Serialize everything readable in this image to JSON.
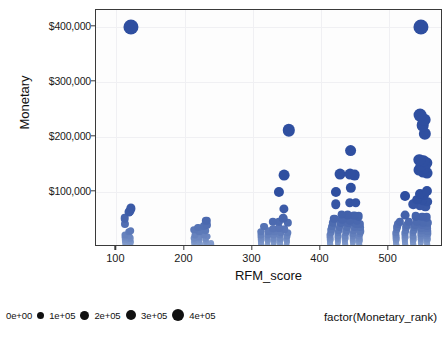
{
  "chart_data": {
    "type": "scatter",
    "title": "",
    "xlabel": "RFM_score",
    "ylabel": "Monetary",
    "xlim": [
      70,
      580
    ],
    "ylim": [
      0,
      430000
    ],
    "grid": true,
    "x_ticks": [
      100,
      200,
      300,
      400,
      500
    ],
    "x_tick_labels": [
      "100",
      "200",
      "300",
      "400",
      "500"
    ],
    "y_ticks": [
      100000,
      200000,
      300000,
      400000
    ],
    "y_tick_labels": [
      "$100,000",
      "$200,000",
      "$300,000",
      "$400,000"
    ],
    "size_encoding": "Monetary",
    "color_encoding": "Monetary",
    "color_low": "#cfe3f5",
    "color_high": "#2f4fa0",
    "legend": {
      "title": "factor(Monetary_rank)",
      "position": "bottom",
      "entries": [
        {
          "label": "0e+00",
          "value": 0,
          "dot_px": 0
        },
        {
          "label": "1e+05",
          "value": 100000,
          "dot_px": 7
        },
        {
          "label": "2e+05",
          "value": 200000,
          "dot_px": 9
        },
        {
          "label": "3e+05",
          "value": 300000,
          "dot_px": 10.5
        },
        {
          "label": "4e+05",
          "value": 400000,
          "dot_px": 12
        }
      ]
    },
    "points": [
      [
        121,
        400000
      ],
      [
        112,
        52000
      ],
      [
        118,
        63000
      ],
      [
        121,
        70000
      ],
      [
        120,
        66000
      ],
      [
        112,
        41000
      ],
      [
        118,
        28000
      ],
      [
        121,
        30000
      ],
      [
        113,
        22000
      ],
      [
        119,
        20000
      ],
      [
        112,
        17000
      ],
      [
        118,
        15500
      ],
      [
        121,
        16500
      ],
      [
        113,
        12500
      ],
      [
        119,
        11500
      ],
      [
        112,
        9000
      ],
      [
        118,
        8500
      ],
      [
        121,
        9500
      ],
      [
        114,
        6500
      ],
      [
        119,
        6000
      ],
      [
        113,
        4500
      ],
      [
        118,
        4000
      ],
      [
        121,
        4200
      ],
      [
        114,
        2800
      ],
      [
        119,
        2400
      ],
      [
        113,
        1600
      ],
      [
        118,
        1400
      ],
      [
        121,
        1500
      ],
      [
        115,
        900
      ],
      [
        119,
        800
      ],
      [
        114,
        500
      ],
      [
        119,
        450
      ],
      [
        117,
        250
      ],
      [
        120,
        200
      ],
      [
        232,
        47000
      ],
      [
        228,
        38000
      ],
      [
        233,
        40000
      ],
      [
        220,
        35000
      ],
      [
        214,
        31000
      ],
      [
        222,
        29000
      ],
      [
        231,
        30000
      ],
      [
        215,
        22000
      ],
      [
        228,
        21000
      ],
      [
        234,
        19000
      ],
      [
        214,
        16000
      ],
      [
        222,
        17500
      ],
      [
        231,
        15500
      ],
      [
        215,
        12000
      ],
      [
        223,
        12500
      ],
      [
        232,
        11000
      ],
      [
        214,
        9000
      ],
      [
        222,
        9500
      ],
      [
        231,
        8500
      ],
      [
        239,
        8000
      ],
      [
        215,
        6500
      ],
      [
        223,
        6000
      ],
      [
        232,
        5500
      ],
      [
        240,
        5200
      ],
      [
        214,
        4200
      ],
      [
        222,
        3800
      ],
      [
        231,
        4000
      ],
      [
        239,
        3500
      ],
      [
        215,
        2600
      ],
      [
        223,
        2300
      ],
      [
        232,
        2400
      ],
      [
        240,
        2200
      ],
      [
        214,
        1500
      ],
      [
        222,
        1300
      ],
      [
        231,
        1400
      ],
      [
        239,
        1200
      ],
      [
        216,
        700
      ],
      [
        224,
        600
      ],
      [
        232,
        650
      ],
      [
        240,
        550
      ],
      [
        218,
        250
      ],
      [
        226,
        200
      ],
      [
        234,
        220
      ],
      [
        241,
        180
      ],
      [
        353,
        212000
      ],
      [
        346,
        130000
      ],
      [
        339,
        99000
      ],
      [
        346,
        69000
      ],
      [
        345,
        52000
      ],
      [
        330,
        46000
      ],
      [
        339,
        45000
      ],
      [
        352,
        44000
      ],
      [
        317,
        37000
      ],
      [
        330,
        33000
      ],
      [
        339,
        34000
      ],
      [
        347,
        32000
      ],
      [
        312,
        28000
      ],
      [
        323,
        28500
      ],
      [
        332,
        27000
      ],
      [
        342,
        26500
      ],
      [
        352,
        25500
      ],
      [
        313,
        22000
      ],
      [
        322,
        22500
      ],
      [
        331,
        21000
      ],
      [
        341,
        21500
      ],
      [
        351,
        20500
      ],
      [
        313,
        17000
      ],
      [
        322,
        17500
      ],
      [
        331,
        16500
      ],
      [
        341,
        16000
      ],
      [
        350,
        15500
      ],
      [
        313,
        13500
      ],
      [
        322,
        13000
      ],
      [
        331,
        13500
      ],
      [
        341,
        12500
      ],
      [
        350,
        12000
      ],
      [
        313,
        10000
      ],
      [
        322,
        10500
      ],
      [
        331,
        9800
      ],
      [
        341,
        9500
      ],
      [
        350,
        9200
      ],
      [
        313,
        7500
      ],
      [
        322,
        7200
      ],
      [
        331,
        7400
      ],
      [
        341,
        7000
      ],
      [
        350,
        6800
      ],
      [
        313,
        5200
      ],
      [
        322,
        5000
      ],
      [
        331,
        5100
      ],
      [
        341,
        4800
      ],
      [
        350,
        4600
      ],
      [
        313,
        3400
      ],
      [
        322,
        3200
      ],
      [
        331,
        3300
      ],
      [
        341,
        3000
      ],
      [
        350,
        2900
      ],
      [
        314,
        2000
      ],
      [
        323,
        1900
      ],
      [
        332,
        1950
      ],
      [
        341,
        1800
      ],
      [
        350,
        1700
      ],
      [
        314,
        1100
      ],
      [
        323,
        1000
      ],
      [
        332,
        1050
      ],
      [
        341,
        950
      ],
      [
        350,
        900
      ],
      [
        315,
        450
      ],
      [
        324,
        400
      ],
      [
        333,
        420
      ],
      [
        342,
        380
      ],
      [
        351,
        350
      ],
      [
        444,
        175000
      ],
      [
        429,
        132000
      ],
      [
        443,
        133000
      ],
      [
        450,
        130000
      ],
      [
        423,
        100000
      ],
      [
        444,
        108000
      ],
      [
        422,
        78000
      ],
      [
        443,
        80000
      ],
      [
        452,
        80000
      ],
      [
        431,
        59000
      ],
      [
        440,
        58000
      ],
      [
        449,
        57000
      ],
      [
        456,
        56000
      ],
      [
        420,
        51000
      ],
      [
        432,
        50000
      ],
      [
        443,
        49000
      ],
      [
        453,
        48000
      ],
      [
        418,
        44000
      ],
      [
        430,
        43500
      ],
      [
        441,
        43000
      ],
      [
        452,
        42500
      ],
      [
        458,
        42000
      ],
      [
        417,
        37000
      ],
      [
        428,
        36500
      ],
      [
        439,
        36000
      ],
      [
        450,
        35500
      ],
      [
        458,
        35000
      ],
      [
        416,
        31000
      ],
      [
        427,
        30500
      ],
      [
        438,
        30000
      ],
      [
        449,
        29500
      ],
      [
        458,
        29000
      ],
      [
        415,
        26000
      ],
      [
        426,
        25500
      ],
      [
        437,
        25000
      ],
      [
        448,
        24500
      ],
      [
        458,
        24000
      ],
      [
        414,
        21000
      ],
      [
        425,
        20500
      ],
      [
        436,
        20000
      ],
      [
        447,
        19500
      ],
      [
        457,
        19000
      ],
      [
        414,
        17000
      ],
      [
        425,
        16500
      ],
      [
        436,
        16000
      ],
      [
        447,
        15500
      ],
      [
        457,
        15000
      ],
      [
        414,
        13000
      ],
      [
        425,
        12500
      ],
      [
        436,
        12000
      ],
      [
        447,
        11800
      ],
      [
        457,
        11500
      ],
      [
        414,
        9500
      ],
      [
        425,
        9200
      ],
      [
        436,
        9000
      ],
      [
        447,
        8800
      ],
      [
        457,
        8500
      ],
      [
        414,
        6800
      ],
      [
        425,
        6500
      ],
      [
        436,
        6300
      ],
      [
        447,
        6100
      ],
      [
        457,
        6000
      ],
      [
        414,
        4500
      ],
      [
        425,
        4300
      ],
      [
        436,
        4200
      ],
      [
        447,
        4000
      ],
      [
        457,
        3900
      ],
      [
        415,
        2700
      ],
      [
        426,
        2500
      ],
      [
        437,
        2400
      ],
      [
        448,
        2300
      ],
      [
        457,
        2200
      ],
      [
        415,
        1400
      ],
      [
        426,
        1300
      ],
      [
        437,
        1250
      ],
      [
        448,
        1200
      ],
      [
        457,
        1150
      ],
      [
        416,
        550
      ],
      [
        427,
        500
      ],
      [
        438,
        480
      ],
      [
        449,
        450
      ],
      [
        457,
        430
      ],
      [
        548,
        400000
      ],
      [
        546,
        240000
      ],
      [
        552,
        231000
      ],
      [
        550,
        221000
      ],
      [
        553,
        205000
      ],
      [
        545,
        158000
      ],
      [
        551,
        156000
      ],
      [
        556,
        152000
      ],
      [
        547,
        147000
      ],
      [
        553,
        144000
      ],
      [
        544,
        139000
      ],
      [
        550,
        137000
      ],
      [
        556,
        134000
      ],
      [
        556,
        101000
      ],
      [
        546,
        97000
      ],
      [
        552,
        95000
      ],
      [
        524,
        93000
      ],
      [
        542,
        86000
      ],
      [
        550,
        84000
      ],
      [
        557,
        82000
      ],
      [
        536,
        78000
      ],
      [
        546,
        75000
      ],
      [
        554,
        73000
      ],
      [
        524,
        58000
      ],
      [
        540,
        56000
      ],
      [
        549,
        55000
      ],
      [
        556,
        54000
      ],
      [
        517,
        46000
      ],
      [
        530,
        45500
      ],
      [
        541,
        45000
      ],
      [
        550,
        44500
      ],
      [
        557,
        44000
      ],
      [
        514,
        41000
      ],
      [
        527,
        40500
      ],
      [
        539,
        40000
      ],
      [
        549,
        39500
      ],
      [
        557,
        39000
      ],
      [
        513,
        36000
      ],
      [
        526,
        35500
      ],
      [
        538,
        35000
      ],
      [
        548,
        34500
      ],
      [
        557,
        34000
      ],
      [
        512,
        31000
      ],
      [
        525,
        30500
      ],
      [
        537,
        30000
      ],
      [
        548,
        29500
      ],
      [
        557,
        29000
      ],
      [
        511,
        26000
      ],
      [
        524,
        25500
      ],
      [
        536,
        25000
      ],
      [
        547,
        24500
      ],
      [
        557,
        24000
      ],
      [
        511,
        21500
      ],
      [
        524,
        21000
      ],
      [
        536,
        20500
      ],
      [
        547,
        20000
      ],
      [
        557,
        19800
      ],
      [
        511,
        17500
      ],
      [
        524,
        17000
      ],
      [
        536,
        16800
      ],
      [
        547,
        16500
      ],
      [
        557,
        16200
      ],
      [
        511,
        14000
      ],
      [
        524,
        13700
      ],
      [
        536,
        13500
      ],
      [
        547,
        13200
      ],
      [
        557,
        13000
      ],
      [
        511,
        10500
      ],
      [
        524,
        10200
      ],
      [
        536,
        10000
      ],
      [
        547,
        9800
      ],
      [
        557,
        9600
      ],
      [
        511,
        7500
      ],
      [
        524,
        7300
      ],
      [
        536,
        7100
      ],
      [
        547,
        6900
      ],
      [
        557,
        6800
      ],
      [
        511,
        5000
      ],
      [
        524,
        4800
      ],
      [
        536,
        4700
      ],
      [
        547,
        4600
      ],
      [
        557,
        4500
      ],
      [
        512,
        3000
      ],
      [
        525,
        2900
      ],
      [
        537,
        2800
      ],
      [
        548,
        2700
      ],
      [
        557,
        2650
      ],
      [
        512,
        1600
      ],
      [
        525,
        1550
      ],
      [
        537,
        1500
      ],
      [
        548,
        1450
      ],
      [
        557,
        1400
      ],
      [
        513,
        600
      ],
      [
        526,
        560
      ],
      [
        538,
        540
      ],
      [
        549,
        520
      ],
      [
        557,
        500
      ]
    ]
  }
}
